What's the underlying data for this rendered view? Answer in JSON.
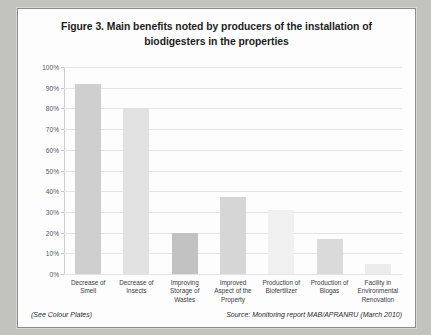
{
  "figure": {
    "title": "Figure 3. Main benefits noted by producers of the installation of biodigesters in the properties",
    "footer_left": "(See Colour Plates)",
    "footer_right": "Source: Monitoring report MAB/APRANRU (March 2010)"
  },
  "chart_data": {
    "type": "bar",
    "title": "Figure 3. Main benefits noted by producers of the installation of biodigesters in the properties",
    "xlabel": "",
    "ylabel": "",
    "ylim": [
      0,
      100
    ],
    "ytick_labels": [
      "100%",
      "90%",
      "80%",
      "70%",
      "60%",
      "50%",
      "40%",
      "30%",
      "20%",
      "10%",
      "0%"
    ],
    "ytick_values": [
      100,
      90,
      80,
      70,
      60,
      50,
      40,
      30,
      20,
      10,
      0
    ],
    "grid": true,
    "legend": false,
    "categories": [
      "Decrease of Smell",
      "Decrease of Insects",
      "Improving Storage of Wastes",
      "Improved Aspect of the Property",
      "Production of Biofertilizer",
      "Production of Biogas",
      "Facility in Environmental Renovation"
    ],
    "values": [
      92,
      80,
      20,
      37,
      31,
      17,
      5
    ],
    "bar_colors": [
      "#cfcfcf",
      "#e2e2e2",
      "#c2c2c2",
      "#d6d6d6",
      "#f0f0f0",
      "#dadada",
      "#ececec"
    ]
  }
}
